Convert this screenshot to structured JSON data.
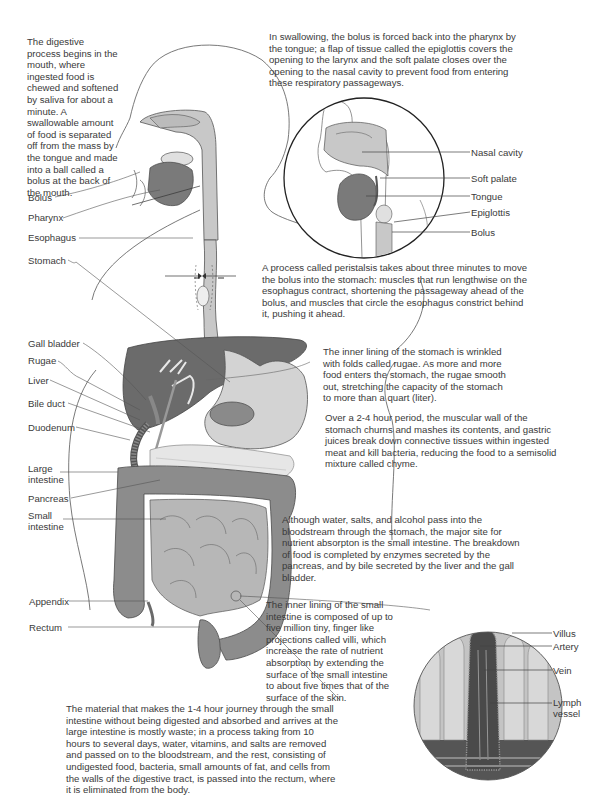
{
  "colors": {
    "outline": "#555555",
    "light_gray": "#c8c8c8",
    "medium_gray": "#9a9a9a",
    "dark_gray": "#6b6b6b",
    "text": "#3a3a3a"
  },
  "paragraphs": {
    "mouth": "The digestive process begins in the mouth, where ingested food is chewed and softened by saliva for about a minute. A swallowable amount of food is separated off from the mass by the tongue and made into a ball called a bolus at the back of the mouth.",
    "swallowing": "In swallowing, the bolus is forced back into the pharynx by the tongue; a flap of tissue called the epiglottis covers the opening to the larynx and the soft palate closes over the opening to the nasal cavity to prevent food from entering these respiratory passageways.",
    "peristalsis": "A process called peristalsis takes about three minutes to move the bolus into the stomach: muscles that run lengthwise on the esophagus contract, shortening the passageway ahead of the bolus, and muscles that circle the esophagus constrict behind it, pushing it ahead.",
    "rugae": "The inner lining of the stomach is wrinkled with folds called rugae. As more and more food enters the stomach, the rugae smooth out, stretching the capacity of the stomach to more than a quart (liter).",
    "chyme": "Over a 2-4 hour period, the muscular wall of the stomach churns and mashes its contents, and gastric juices break down connective tissues within ingested meat and kill bacteria, reducing the food to a semisolid mixture called chyme.",
    "absorption": "Although water, salts, and alcohol pass into the bloodstream through the stomach, the major site for nutrient absorpton is the small intestine. The breakdown of food is completed by enzymes secreted by the pancreas, and by bile secreted by the liver and the gall bladder.",
    "villi": "The inner lining of the small intestine is composed of up to five million tiny, finger like projections called villi, which increase the rate of nutrient absorption by extending the surface of the small intestine to about five times that of the surface of the skin.",
    "large_intestine": "The material that makes the 1-4 hour journey through the small intestine without being digested and absorbed and arrives at the large intestine is mostly waste; in a process taking from 10 hours to several days, water, vitamins, and salts are removed and passed on to the bloodstream, and the rest, consisting of undigested food, bacteria, small amounts of fat, and cells from the walls of the digestive tract, is passed into the rectum, where it is eliminated from the body."
  },
  "body_labels": {
    "bolus": "Bolus",
    "pharynx": "Pharynx",
    "esophagus": "Esophagus",
    "stomach": "Stomach",
    "gall_bladder": "Gall bladder",
    "rugae": "Rugae",
    "liver": "Liver",
    "bile_duct": "Bile duct",
    "duodenum": "Duodenum",
    "large_intestine_1": "Large",
    "large_intestine_2": "intestine",
    "pancreas": "Pancreas",
    "small_intestine_1": "Small",
    "small_intestine_2": "intestine",
    "appendix": "Appendix",
    "rectum": "Rectum"
  },
  "inset_head_labels": {
    "nasal_cavity": "Nasal cavity",
    "soft_palate": "Soft palate",
    "tongue": "Tongue",
    "epiglottis": "Epiglottis",
    "bolus": "Bolus"
  },
  "inset_villus_labels": {
    "villus": "Villus",
    "artery": "Artery",
    "vein": "Vein",
    "lymph_1": "Lymph",
    "lymph_2": "vessel"
  }
}
